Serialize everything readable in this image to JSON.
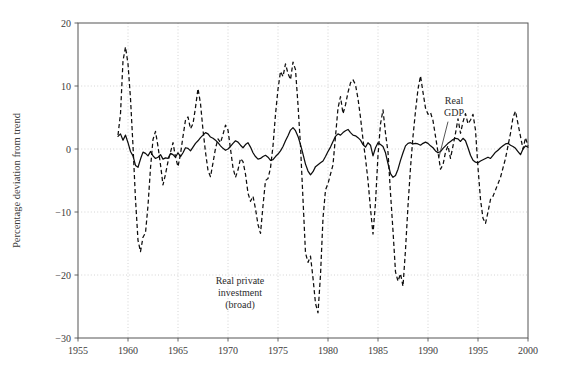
{
  "chart_data": {
    "type": "line",
    "title": "",
    "xlabel": "",
    "ylabel": "Percentage deviation from trend",
    "xlim": [
      1955,
      2000
    ],
    "ylim": [
      -30,
      20
    ],
    "xticks": [
      1955,
      1960,
      1965,
      1970,
      1975,
      1980,
      1985,
      1990,
      1995,
      2000
    ],
    "yticks": [
      -30,
      -20,
      -10,
      0,
      10,
      20
    ],
    "xtick_labels": [
      "1955",
      "1960",
      "1965",
      "1970",
      "1975",
      "1980",
      "1985",
      "1990",
      "1995",
      "2000"
    ],
    "ytick_labels": [
      "−30",
      "−20",
      "−10",
      "0",
      "10",
      "20"
    ],
    "grid": true,
    "grid_style": "dotted",
    "legend_position": "inline-annotations",
    "x_start": 1959.0,
    "x_step": 0.25,
    "series": [
      {
        "name": "Real GDP",
        "style": "solid",
        "color": "#0d0d0d",
        "annotation": "Real GDP",
        "annotation_x": 1992.6,
        "annotation_y": 7.2,
        "leader_to_x": 1991.1,
        "leader_to_y": -1.6,
        "values": [
          2.0,
          2.4,
          1.4,
          2.2,
          1.0,
          -0.4,
          -1.1,
          -2.6,
          -2.9,
          -1.6,
          -0.5,
          -0.7,
          -1.1,
          -0.4,
          -1.1,
          -1.5,
          -1.3,
          -0.9,
          -1.6,
          -1.4,
          -1.5,
          -0.7,
          -0.9,
          -1.3,
          -0.6,
          -1.2,
          -0.6,
          0.2,
          0.1,
          -0.3,
          0.3,
          0.9,
          1.3,
          1.8,
          2.2,
          2.6,
          2.4,
          1.9,
          1.7,
          1.4,
          1.0,
          0.5,
          0.1,
          -0.2,
          0.0,
          0.4,
          0.9,
          1.3,
          1.1,
          0.6,
          0.2,
          0.7,
          1.0,
          0.3,
          -0.6,
          -1.2,
          -1.6,
          -1.5,
          -1.2,
          -1.0,
          -1.3,
          -1.8,
          -1.7,
          -1.2,
          -0.8,
          -0.3,
          0.4,
          1.3,
          2.1,
          3.0,
          3.4,
          2.9,
          2.0,
          0.7,
          -0.8,
          -2.4,
          -3.5,
          -4.1,
          -3.6,
          -2.8,
          -2.5,
          -2.2,
          -1.9,
          -1.2,
          -0.4,
          0.3,
          1.2,
          2.0,
          2.4,
          2.2,
          2.6,
          2.9,
          3.1,
          2.6,
          2.2,
          2.1,
          1.8,
          1.4,
          0.7,
          0.3,
          1.0,
          0.6,
          -1.1,
          0.2,
          1.0,
          0.7,
          0.4,
          -0.6,
          -2.3,
          -3.9,
          -4.5,
          -4.2,
          -3.2,
          -1.8,
          -0.6,
          0.5,
          0.9,
          1.0,
          0.8,
          0.9,
          0.8,
          0.6,
          0.9,
          1.1,
          0.9,
          0.5,
          0.2,
          -0.3,
          -0.6,
          -0.4,
          0.1,
          0.5,
          0.9,
          1.2,
          1.5,
          1.7,
          1.6,
          1.2,
          1.7,
          1.3,
          0.2,
          -1.0,
          -1.8,
          -2.1,
          -2.2,
          -1.9,
          -1.7,
          -1.5,
          -1.3,
          -1.5,
          -1.0,
          -0.5,
          -0.2,
          0.2,
          0.5,
          0.8,
          0.9,
          0.6,
          0.4,
          0.1,
          -0.4,
          -0.9,
          0.0,
          0.5,
          0.3
        ]
      },
      {
        "name": "Real private investment (broad)",
        "style": "dashed",
        "color": "#0d0d0d",
        "annotation_lines": [
          "Real private",
          "investment",
          "(broad)"
        ],
        "annotation_x": 1971.2,
        "annotation_y": -21.5,
        "values": [
          2.2,
          5.6,
          14.0,
          16.2,
          13.5,
          8.0,
          0.5,
          -8.0,
          -14.5,
          -16.3,
          -14.0,
          -13.3,
          -9.0,
          -3.0,
          1.5,
          2.8,
          0.4,
          -2.5,
          -5.7,
          -4.0,
          -2.0,
          -0.5,
          1.0,
          -1.3,
          -2.8,
          -0.8,
          2.0,
          4.6,
          5.1,
          3.2,
          4.0,
          6.6,
          9.6,
          7.2,
          3.0,
          -0.5,
          -3.4,
          -4.4,
          -2.2,
          0.1,
          1.6,
          1.0,
          2.3,
          3.8,
          3.0,
          0.0,
          -3.0,
          -4.5,
          -3.3,
          -1.5,
          -2.0,
          -4.0,
          -7.0,
          -8.3,
          -7.5,
          -9.5,
          -12.0,
          -13.4,
          -9.0,
          -5.0,
          -4.7,
          -3.0,
          0.5,
          5.5,
          9.5,
          12.3,
          11.5,
          13.5,
          12.0,
          11.0,
          13.8,
          12.6,
          7.0,
          0.5,
          -8.0,
          -16.5,
          -18.0,
          -17.0,
          -20.5,
          -24.5,
          -26.0,
          -20.0,
          -11.0,
          -6.5,
          -5.5,
          -4.0,
          -2.5,
          2.0,
          6.5,
          8.3,
          5.6,
          7.0,
          9.0,
          10.5,
          11.0,
          10.2,
          8.0,
          5.0,
          1.5,
          -1.5,
          -5.0,
          -9.5,
          -13.5,
          -8.5,
          -1.0,
          4.0,
          6.2,
          2.5,
          -0.5,
          -7.0,
          -13.0,
          -19.5,
          -21.0,
          -19.8,
          -21.8,
          -16.0,
          -9.0,
          -3.0,
          2.0,
          6.0,
          9.5,
          11.6,
          9.0,
          6.5,
          5.5,
          5.8,
          4.5,
          2.0,
          -0.5,
          -3.2,
          -2.5,
          -0.5,
          0.5,
          -1.5,
          0.5,
          2.5,
          4.8,
          2.5,
          4.3,
          5.6,
          4.0,
          4.6,
          5.5,
          3.0,
          -3.0,
          -8.0,
          -11.0,
          -11.8,
          -10.0,
          -8.0,
          -7.5,
          -6.5,
          -5.5,
          -4.5,
          -3.0,
          -1.5,
          0.5,
          2.5,
          5.0,
          6.0,
          4.0,
          2.0,
          0.0,
          1.8,
          0.5
        ]
      }
    ]
  },
  "axis": {
    "ylabel": "Percentage deviation from trend"
  }
}
